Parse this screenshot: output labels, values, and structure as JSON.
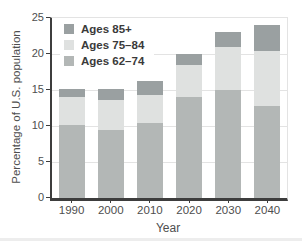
{
  "chart_data": {
    "type": "bar",
    "stacked": true,
    "title": "",
    "xlabel": "Year",
    "ylabel": "Percentage of U.S. population",
    "categories": [
      "1990",
      "2000",
      "2010",
      "2020",
      "2030",
      "2040"
    ],
    "series": [
      {
        "name": "Ages 62–74",
        "color": "#b3b7b6",
        "values": [
          10.2,
          9.4,
          10.4,
          14.0,
          15.0,
          12.8
        ]
      },
      {
        "name": "Ages 75–84",
        "color": "#dfe1e0",
        "values": [
          3.8,
          4.2,
          3.9,
          4.5,
          6.0,
          7.6
        ]
      },
      {
        "name": "Ages 85+",
        "color": "#9aa0a1",
        "values": [
          1.2,
          1.5,
          1.9,
          1.5,
          2.0,
          3.6
        ]
      }
    ],
    "totals": [
      15.2,
      15.1,
      16.2,
      20.0,
      23.0,
      24.0
    ],
    "legend": {
      "position": "top-left",
      "order": [
        "Ages 85+",
        "Ages 75–84",
        "Ages 62–74"
      ]
    },
    "ylim": [
      0,
      25
    ],
    "yticks": [
      0,
      5,
      10,
      15,
      20,
      25
    ],
    "grid": "horizontal",
    "colors": {
      "axis": "#3d3d3d",
      "grid": "#e3e3e3",
      "tick_text": "#4e4e4e",
      "background": "#ffffff"
    }
  }
}
